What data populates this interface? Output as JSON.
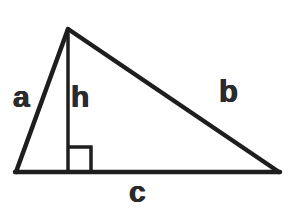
{
  "figure": {
    "name": "triangle-with-altitude",
    "background_color": "#ffffff",
    "stroke_color": "#1e1e1e",
    "label_color": "#2b2b2b",
    "stroke_width": 4,
    "canvas": {
      "width": 295,
      "height": 210
    }
  },
  "geometry": {
    "vertices": {
      "bottom_left": {
        "x": 16,
        "y": 172
      },
      "apex": {
        "x": 68,
        "y": 29
      },
      "bottom_right": {
        "x": 279,
        "y": 172
      }
    },
    "altitude": {
      "from": {
        "x": 68,
        "y": 29
      },
      "to": {
        "x": 68,
        "y": 172
      }
    },
    "right_angle_marker": {
      "x": 68,
      "y": 147,
      "size": 24
    }
  },
  "labels": {
    "a": "a",
    "b": "b",
    "c": "c",
    "h": "h"
  }
}
